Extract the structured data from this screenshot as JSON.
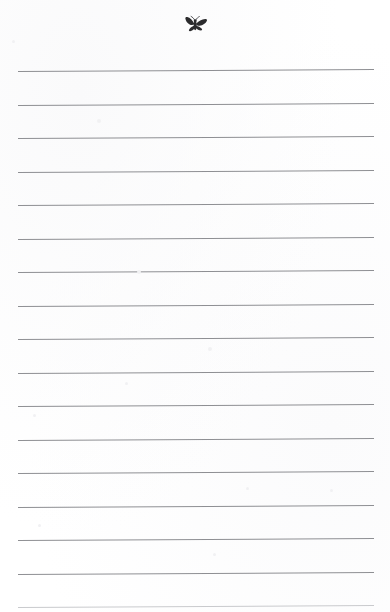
{
  "document": {
    "kind": "scanned-ruled-notepad-page",
    "page_width": 390,
    "page_height": 612,
    "background_color": "#ffffff",
    "body_text": "",
    "masthead": {
      "illustration_name": "butterfly-moth",
      "illustration_color": "#2b2b2d",
      "center_x": 196,
      "center_y": 26,
      "width": 22,
      "height": 16
    },
    "ruling": {
      "line_color": "#8e8f93",
      "faint_line_color": "#c9cacd",
      "line_thickness": 1,
      "left_margin": 18,
      "right_margin": 374,
      "line_length": 356,
      "spacing": 33.5,
      "tilt_degrees": -0.32,
      "line_count": 17,
      "line_tops": [
        71,
        104.5,
        138,
        171.5,
        205,
        238.5,
        272,
        305.5,
        339,
        372.5,
        406,
        439.5,
        473,
        506.5,
        540,
        573.5,
        607
      ],
      "last_line_partial": true
    },
    "specks": [
      {
        "x": 12,
        "y": 40,
        "size": 3
      },
      {
        "x": 97,
        "y": 119,
        "size": 4
      },
      {
        "x": 137,
        "y": 270,
        "size": 4
      },
      {
        "x": 208,
        "y": 347,
        "size": 4
      },
      {
        "x": 125,
        "y": 382,
        "size": 3
      },
      {
        "x": 33,
        "y": 414,
        "size": 3
      },
      {
        "x": 246,
        "y": 487,
        "size": 3
      },
      {
        "x": 330,
        "y": 489,
        "size": 3
      },
      {
        "x": 38,
        "y": 524,
        "size": 3
      },
      {
        "x": 213,
        "y": 553,
        "size": 3
      }
    ]
  }
}
